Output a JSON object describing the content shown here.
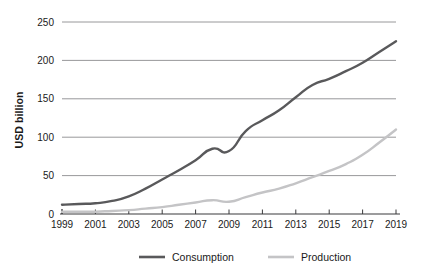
{
  "chart_data": {
    "type": "line",
    "title": "",
    "subtitle": "",
    "xlabel": "",
    "ylabel": "USD billion",
    "x": [
      1999,
      2000,
      2001,
      2002,
      2003,
      2004,
      2005,
      2006,
      2007,
      2008,
      2009,
      2010,
      2011,
      2012,
      2013,
      2014,
      2015,
      2016,
      2017,
      2018,
      2019
    ],
    "xlim": [
      1999,
      2019
    ],
    "ylim": [
      0,
      250
    ],
    "yticks": [
      0,
      50,
      100,
      150,
      200,
      250
    ],
    "ytick_labels": [
      "0",
      "50",
      "100",
      "150",
      "200",
      "250"
    ],
    "xticks": [
      1999,
      2001,
      2003,
      2005,
      2007,
      2009,
      2011,
      2013,
      2015,
      2017,
      2019
    ],
    "xtick_labels": [
      "1999",
      "2001",
      "2003",
      "2005",
      "2007",
      "2009",
      "2011",
      "2013",
      "2015",
      "2017",
      "2019"
    ],
    "grid": "horizontal",
    "legend_position": "bottom",
    "series": [
      {
        "name": "Consumption",
        "color": "#59595b",
        "values": [
          12,
          13,
          14,
          17,
          23,
          33,
          45,
          57,
          70,
          85,
          82,
          108,
          122,
          135,
          152,
          168,
          176,
          186,
          197,
          211,
          225
        ]
      },
      {
        "name": "Production",
        "color": "#c4c4c6",
        "values": [
          3,
          3,
          3,
          4,
          5,
          7,
          9,
          12,
          15,
          18,
          16,
          22,
          28,
          33,
          40,
          48,
          56,
          65,
          77,
          93,
          110
        ]
      }
    ]
  },
  "axes": {
    "y_title": "USD billion"
  },
  "legend": {
    "items": [
      {
        "label": "Consumption",
        "color": "#59595b"
      },
      {
        "label": "Production",
        "color": "#c4c4c6"
      }
    ]
  }
}
